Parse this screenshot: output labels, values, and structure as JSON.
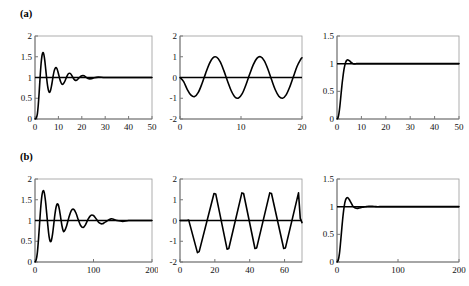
{
  "figure": {
    "background": "#ffffff",
    "curve_color": "#000000",
    "axis_color": "#9a9a9a",
    "rows": [
      {
        "id": "a",
        "label": "(a)"
      },
      {
        "id": "b",
        "label": "(b)"
      }
    ]
  },
  "chart_data": [
    {
      "panel": "a1",
      "type": "line",
      "title": "",
      "xlabel": "",
      "ylabel": "",
      "xlim": [
        0,
        50
      ],
      "ylim": [
        0,
        2
      ],
      "xticks": [
        0,
        10,
        20,
        30,
        40,
        50
      ],
      "yticks": [
        0,
        0.5,
        1,
        1.5,
        2
      ],
      "xtick_labels": [
        "0",
        "10",
        "20",
        "30",
        "40",
        "50"
      ],
      "ytick_labels": [
        "0",
        "0.5",
        "1",
        "1.5",
        "2"
      ],
      "grid": false,
      "legend": null,
      "description": "damped oscillatory step response settling to 1",
      "reference_line": 1,
      "series": [
        {
          "name": "response",
          "x": [
            0,
            0.5,
            1,
            1.4,
            1.8,
            2.2,
            2.6,
            3,
            3.4,
            3.8,
            4.2,
            4.6,
            5,
            5.4,
            5.8,
            6.2,
            6.6,
            7,
            7.4,
            7.8,
            8.2,
            8.6,
            9,
            9.4,
            9.8,
            10.2,
            10.6,
            11,
            11.5,
            12,
            12.5,
            13,
            13.5,
            14,
            14.5,
            15,
            15.5,
            16,
            16.5,
            17,
            17.5,
            18,
            19,
            20,
            21,
            22,
            23,
            24,
            25,
            27,
            30,
            35,
            40,
            45,
            50
          ],
          "y": [
            0,
            0.02,
            0.12,
            0.34,
            0.66,
            1.02,
            1.33,
            1.53,
            1.6,
            1.55,
            1.4,
            1.19,
            0.97,
            0.79,
            0.68,
            0.64,
            0.68,
            0.78,
            0.91,
            1.05,
            1.16,
            1.22,
            1.24,
            1.21,
            1.14,
            1.05,
            0.96,
            0.89,
            0.84,
            0.84,
            0.88,
            0.94,
            1.01,
            1.07,
            1.1,
            1.1,
            1.07,
            1.02,
            0.97,
            0.94,
            0.93,
            0.94,
            1.0,
            1.04,
            1.04,
            1.0,
            0.97,
            0.97,
            0.99,
            1.01,
            1.0,
            1.0,
            1.0,
            1.0,
            1.0
          ]
        }
      ]
    },
    {
      "panel": "a2",
      "type": "line",
      "title": "",
      "xlabel": "",
      "ylabel": "",
      "xlim": [
        0,
        20
      ],
      "ylim": [
        -2,
        2
      ],
      "xticks": [
        0,
        10,
        20
      ],
      "yticks": [
        -2,
        -1,
        0,
        1,
        2
      ],
      "xtick_labels": [
        "0",
        "10",
        "20"
      ],
      "ytick_labels": [
        "-2",
        "-1",
        "0",
        "1",
        "2"
      ],
      "grid": false,
      "legend": null,
      "description": "sustained sinusoidal oscillation, amplitude 1, period about 5.7",
      "reference_line": 0,
      "series": [
        {
          "name": "oscillation",
          "amplitude": 1.0,
          "period": 5.7,
          "phase_start": 1.2,
          "x": [
            0,
            0.6,
            1.2,
            1.8,
            2.4,
            3.0,
            3.6,
            4.2,
            4.8,
            5.4,
            6.0,
            6.6,
            7.2,
            7.8,
            8.4,
            9.0,
            9.6,
            10.2,
            10.8,
            11.4,
            12.0,
            12.6,
            13.2,
            13.8,
            14.4,
            15.0,
            15.6,
            16.2,
            16.8,
            17.4,
            18.0,
            18.6,
            19.2,
            19.8,
            20
          ],
          "y": [
            0,
            -0.2,
            -0.58,
            -0.85,
            -0.92,
            -0.72,
            -0.3,
            0.2,
            0.66,
            0.95,
            0.98,
            0.75,
            0.32,
            -0.18,
            -0.64,
            -0.94,
            -0.99,
            -0.78,
            -0.36,
            0.14,
            0.61,
            0.92,
            1.0,
            0.81,
            0.41,
            -0.1,
            -0.58,
            -0.9,
            -1.0,
            -0.84,
            -0.45,
            0.05,
            0.54,
            0.88,
            0.95
          ]
        }
      ]
    },
    {
      "panel": "a3",
      "type": "line",
      "title": "",
      "xlabel": "",
      "ylabel": "",
      "xlim": [
        0,
        50
      ],
      "ylim": [
        0,
        1.5
      ],
      "xticks": [
        0,
        10,
        20,
        30,
        40,
        50
      ],
      "yticks": [
        0,
        0.5,
        1,
        1.5
      ],
      "xtick_labels": [
        "0",
        "10",
        "20",
        "30",
        "40",
        "50"
      ],
      "ytick_labels": [
        "0",
        "0.5",
        "1",
        "1.5"
      ],
      "grid": false,
      "legend": null,
      "description": "fast settling step response with small overshoot to about 1.06",
      "reference_line": 1,
      "series": [
        {
          "name": "response",
          "overshoot": 1.06,
          "x": [
            0,
            0.4,
            0.8,
            1.2,
            1.6,
            2.0,
            2.4,
            2.8,
            3.2,
            3.6,
            4.0,
            4.4,
            4.8,
            5.2,
            5.6,
            6.0,
            6.5,
            7,
            7.5,
            8,
            9,
            10,
            12,
            15,
            20,
            25,
            30,
            35,
            40,
            45,
            50
          ],
          "y": [
            0,
            0.02,
            0.1,
            0.24,
            0.42,
            0.6,
            0.75,
            0.88,
            0.97,
            1.03,
            1.06,
            1.07,
            1.06,
            1.05,
            1.03,
            1.02,
            1.0,
            0.995,
            0.995,
            1.0,
            1.0,
            1.0,
            1.0,
            1.0,
            1.0,
            1.0,
            1.0,
            1.0,
            1.0,
            1.0,
            1.0
          ]
        }
      ]
    },
    {
      "panel": "b1",
      "type": "line",
      "title": "",
      "xlabel": "",
      "ylabel": "",
      "xlim": [
        0,
        200
      ],
      "ylim": [
        0,
        2
      ],
      "xticks": [
        0,
        100,
        200
      ],
      "yticks": [
        0,
        0.5,
        1,
        1.5,
        2
      ],
      "xtick_labels": [
        "0",
        "100",
        "200"
      ],
      "ytick_labels": [
        "0",
        "0.5",
        "1",
        "1.5",
        "2"
      ],
      "grid": false,
      "legend": null,
      "description": "lightly damped oscillatory step response settling to 1, peak about 1.72",
      "reference_line": 1,
      "series": [
        {
          "name": "response",
          "peak": 1.72,
          "x": [
            0,
            2,
            4,
            6,
            8,
            10,
            12,
            14,
            16,
            18,
            20,
            22,
            24,
            26,
            28,
            30,
            32,
            34,
            36,
            38,
            40,
            42,
            44,
            46,
            48,
            50,
            54,
            58,
            62,
            66,
            70,
            74,
            78,
            82,
            86,
            90,
            95,
            100,
            105,
            110,
            115,
            120,
            130,
            140,
            150,
            160,
            175,
            190,
            200
          ],
          "y": [
            0,
            0.05,
            0.22,
            0.55,
            0.96,
            1.35,
            1.62,
            1.72,
            1.66,
            1.46,
            1.17,
            0.87,
            0.62,
            0.5,
            0.52,
            0.67,
            0.9,
            1.14,
            1.32,
            1.4,
            1.37,
            1.24,
            1.06,
            0.88,
            0.76,
            0.74,
            0.87,
            1.08,
            1.24,
            1.27,
            1.18,
            1.02,
            0.88,
            0.83,
            0.89,
            1.01,
            1.12,
            1.12,
            1.03,
            0.94,
            0.92,
            0.96,
            1.04,
            1.0,
            0.98,
            1.0,
            1.0,
            1.0,
            1.0
          ]
        }
      ]
    },
    {
      "panel": "b2",
      "type": "line",
      "title": "",
      "xlabel": "",
      "ylabel": "",
      "xlim": [
        0,
        70
      ],
      "ylim": [
        -2,
        2
      ],
      "xticks": [
        0,
        20,
        40,
        60
      ],
      "yticks": [
        -2,
        -1,
        0,
        1,
        2
      ],
      "xtick_labels": [
        "0",
        "20",
        "40",
        "60"
      ],
      "ytick_labels": [
        "-2",
        "-1",
        "0",
        "1",
        "2"
      ],
      "grid": false,
      "legend": null,
      "description": "sustained triangular relaxation oscillation, amplitude about 1.35, period about 16.5",
      "reference_line": 0,
      "series": [
        {
          "name": "oscillation",
          "amplitude": 1.35,
          "period": 16.5,
          "x": [
            0,
            2,
            4,
            5,
            10,
            11,
            19.5,
            20.5,
            27,
            28,
            35.5,
            36.5,
            43,
            44,
            51.5,
            52.5,
            59.5,
            60.5,
            68,
            69,
            70
          ],
          "y": [
            0,
            0,
            0,
            0.02,
            -1.55,
            -1.5,
            1.3,
            1.28,
            -1.38,
            -1.35,
            1.33,
            1.3,
            -1.35,
            -1.32,
            1.33,
            1.3,
            -1.35,
            -1.32,
            1.33,
            0.1,
            -0.1
          ]
        }
      ]
    },
    {
      "panel": "b3",
      "type": "line",
      "title": "",
      "xlabel": "",
      "ylabel": "",
      "xlim": [
        0,
        200
      ],
      "ylim": [
        0,
        1.5
      ],
      "xticks": [
        0,
        100,
        200
      ],
      "yticks": [
        0,
        0.5,
        1,
        1.5
      ],
      "xtick_labels": [
        "0",
        "100",
        "200"
      ],
      "ytick_labels": [
        "0",
        "0.5",
        "1",
        "1.5"
      ],
      "grid": false,
      "legend": null,
      "description": "step response with overshoot to about 1.16 settling to 1",
      "reference_line": 1,
      "series": [
        {
          "name": "response",
          "overshoot": 1.16,
          "x": [
            0,
            2,
            4,
            6,
            8,
            10,
            12,
            14,
            16,
            18,
            20,
            22,
            24,
            26,
            28,
            30,
            33,
            36,
            40,
            44,
            48,
            52,
            58,
            64,
            70,
            80,
            90,
            100,
            120,
            140,
            160,
            180,
            200
          ],
          "y": [
            0,
            0.03,
            0.15,
            0.37,
            0.62,
            0.85,
            1.02,
            1.12,
            1.16,
            1.16,
            1.13,
            1.09,
            1.05,
            1.01,
            0.99,
            0.975,
            0.97,
            0.975,
            0.985,
            0.995,
            1.0,
            1.005,
            1.005,
            1.0,
            1.0,
            1.0,
            1.0,
            1.0,
            1.0,
            1.0,
            1.0,
            1.0,
            1.0
          ]
        }
      ]
    }
  ]
}
